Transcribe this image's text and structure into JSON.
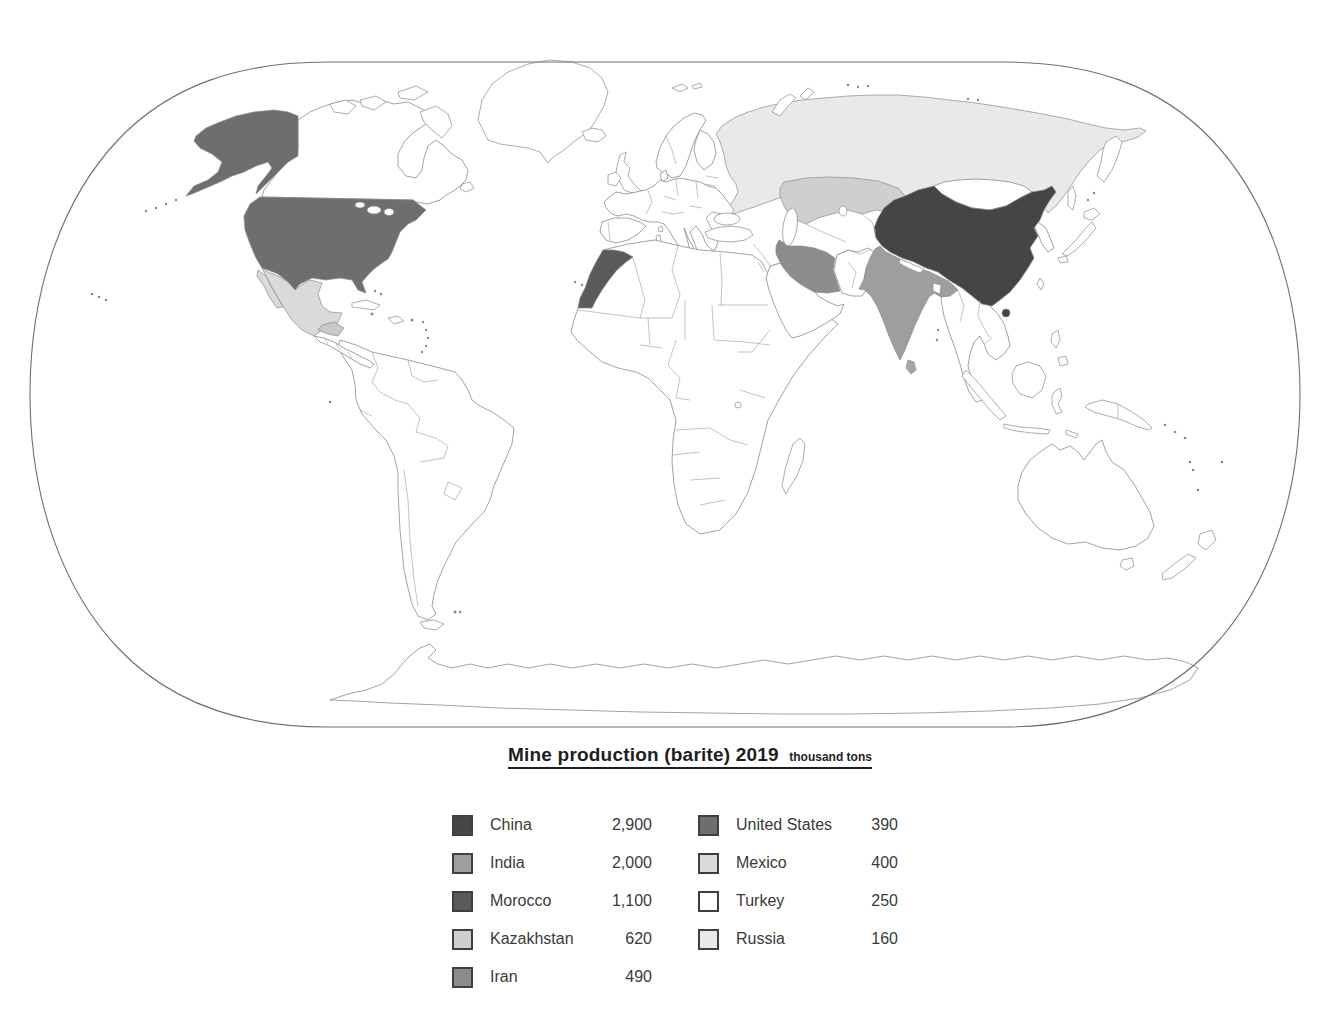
{
  "title": {
    "text": "Mine production (barite) 2019",
    "unit_suffix": "thousand tons"
  },
  "legend": {
    "left_column": [
      {
        "name": "China",
        "value": "2,900",
        "color": "#454545"
      },
      {
        "name": "India",
        "value": "2,000",
        "color": "#9e9e9e"
      },
      {
        "name": "Morocco",
        "value": "1,100",
        "color": "#5a5a5a"
      },
      {
        "name": "Kazakhstan",
        "value": "620",
        "color": "#cfcfcf"
      },
      {
        "name": "Iran",
        "value": "490",
        "color": "#8c8c8c"
      }
    ],
    "right_column": [
      {
        "name": "United States",
        "value": "390",
        "color": "#6e6e6e"
      },
      {
        "name": "Mexico",
        "value": "400",
        "color": "#dadada"
      },
      {
        "name": "Turkey",
        "value": "250",
        "color": "#ffffff"
      },
      {
        "name": "Russia",
        "value": "160",
        "color": "#e9e9e9"
      }
    ]
  },
  "map": {
    "frame_color": "#6f6f6f",
    "land_fill": "#ffffff",
    "land_outline": "#8a8a8a",
    "countries": {
      "china": {
        "label": "China",
        "color": "#454545"
      },
      "india": {
        "label": "India",
        "color": "#9e9e9e"
      },
      "morocco": {
        "label": "Morocco",
        "color": "#5a5a5a"
      },
      "kazakhstan": {
        "label": "Kazakhstan",
        "color": "#cfcfcf"
      },
      "iran": {
        "label": "Iran",
        "color": "#8c8c8c"
      },
      "united_states": {
        "label": "United States",
        "color": "#6e6e6e"
      },
      "mexico": {
        "label": "Mexico",
        "color": "#dadada"
      },
      "turkey": {
        "label": "Turkey",
        "color": "#ffffff"
      },
      "russia": {
        "label": "Russia",
        "color": "#e9e9e9"
      }
    }
  }
}
